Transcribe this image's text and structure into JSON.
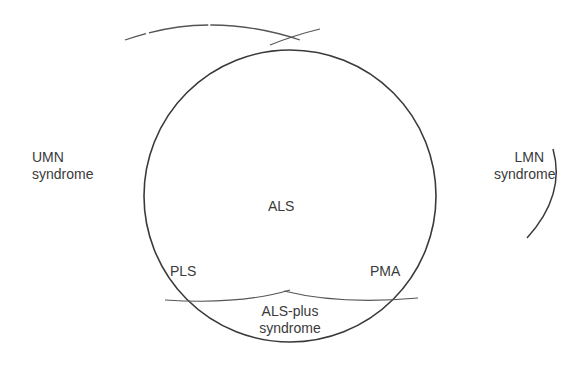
{
  "diagram": {
    "type": "venn-overlap",
    "stroke_color": "#3a3a3a",
    "background": "#ffffff",
    "labels": {
      "umn_line1": "UMN",
      "umn_line2": "syndrome",
      "lmn_line1": "LMN",
      "lmn_line2": "syndrome",
      "als": "ALS",
      "pls": "PLS",
      "pma": "PMA",
      "als_plus_line1": "ALS-plus",
      "als_plus_line2": "syndrome"
    },
    "regions": [
      {
        "name": "UMN syndrome",
        "position": "left"
      },
      {
        "name": "LMN syndrome",
        "position": "right"
      },
      {
        "name": "ALS",
        "position": "center"
      },
      {
        "name": "PLS",
        "position": "lower-left inside circle"
      },
      {
        "name": "PMA",
        "position": "lower-right inside circle"
      },
      {
        "name": "ALS-plus syndrome",
        "position": "bottom segment"
      }
    ]
  }
}
